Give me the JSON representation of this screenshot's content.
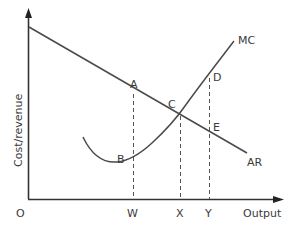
{
  "diagram": {
    "type": "economics cost/revenue diagram",
    "axes": {
      "origin_label": "O",
      "y_label": "Cost/revenue",
      "x_label": "Output"
    },
    "curves": [
      {
        "name": "MC",
        "label": "MC",
        "shape": "U-shaped, rising steeply to the right"
      },
      {
        "name": "AR",
        "label": "AR",
        "shape": "downward-sloping straight line"
      }
    ],
    "points": {
      "A": "A",
      "B": "B",
      "C": "C",
      "D": "D",
      "E": "E"
    },
    "x_ticks": {
      "W": "W",
      "X": "X",
      "Y": "Y"
    },
    "colors": {
      "line": "#4a4a4a",
      "text": "#3a3a3a",
      "background": "#ffffff"
    }
  }
}
